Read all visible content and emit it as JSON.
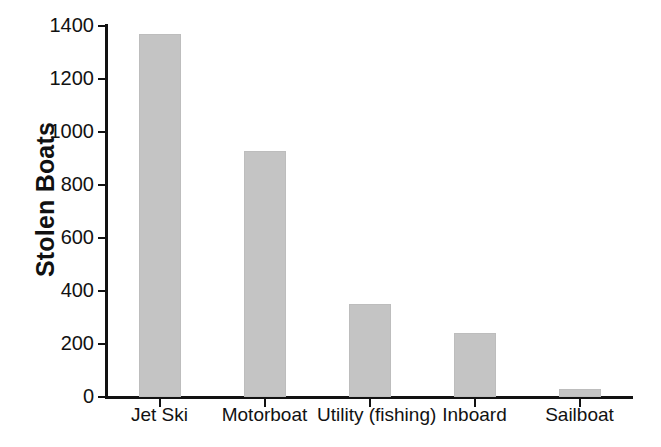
{
  "chart_data": {
    "type": "bar",
    "title": "",
    "subtitle": "",
    "xlabel": "",
    "ylabel": "Stolen Boats",
    "categories": [
      "Jet Ski",
      "Motorboat",
      "Utility (fishing)",
      "Inboard",
      "Sailboat"
    ],
    "values": [
      1370,
      930,
      350,
      240,
      30
    ],
    "ylim": [
      0,
      1400
    ],
    "y_ticks": [
      0,
      200,
      400,
      600,
      800,
      1000,
      1200,
      1400
    ],
    "y_tick_labels": [
      "0",
      "200",
      "400",
      "600",
      "800",
      "1000",
      "1200",
      "1400"
    ],
    "grid": false,
    "legend": false,
    "legend_position": "none",
    "bar_color": "#c4c4c4",
    "bar_edge_color": "#bdbdbd",
    "axis_color": "#121212",
    "background_color": "#ffffff",
    "text_color": "#121212"
  },
  "axes": {
    "y_title": "Stolen Boats"
  }
}
